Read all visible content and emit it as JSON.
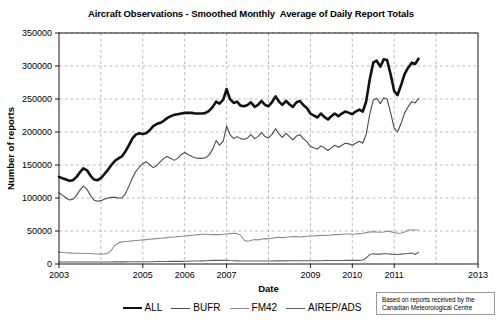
{
  "chart_data": {
    "type": "line",
    "title": "Aircraft Observations - Smoothed Monthly  Average of Daily Report Totals",
    "xlabel": "Date",
    "ylabel": "Number of reports",
    "xlim": [
      2003,
      2013
    ],
    "ylim": [
      0,
      350000
    ],
    "grid": true,
    "grid_style": "dashed",
    "legend_position": "bottom-center",
    "ytick_labels": [
      "0",
      "50000",
      "100000",
      "150000",
      "200000",
      "250000",
      "300000",
      "350000"
    ],
    "ytick_values": [
      0,
      50000,
      100000,
      150000,
      200000,
      250000,
      300000,
      350000
    ],
    "xtick_labels": [
      "2003",
      "2005",
      "2006",
      "2007",
      "2009",
      "2010",
      "2011",
      "2013"
    ],
    "xtick_values": [
      2003,
      2005,
      2006,
      2007,
      2009,
      2010,
      2011,
      2013
    ],
    "xgrid_values": [
      2004,
      2005,
      2006,
      2007,
      2008,
      2009,
      2010,
      2011,
      2012
    ],
    "annotation": {
      "line1": "Based on reports received by the",
      "line2": "Canadian Meteorological Centre"
    },
    "series": [
      {
        "name": "ALL",
        "color": "#111111",
        "width": 2.6,
        "x": [
          2003.0,
          2003.08,
          2003.17,
          2003.25,
          2003.33,
          2003.42,
          2003.5,
          2003.58,
          2003.67,
          2003.75,
          2003.83,
          2003.92,
          2004.0,
          2004.08,
          2004.17,
          2004.25,
          2004.33,
          2004.42,
          2004.5,
          2004.58,
          2004.67,
          2004.75,
          2004.83,
          2004.92,
          2005.0,
          2005.08,
          2005.17,
          2005.25,
          2005.33,
          2005.42,
          2005.5,
          2005.58,
          2005.67,
          2005.75,
          2005.83,
          2005.92,
          2006.0,
          2006.08,
          2006.17,
          2006.25,
          2006.33,
          2006.42,
          2006.5,
          2006.58,
          2006.67,
          2006.75,
          2006.83,
          2006.92,
          2007.0,
          2007.08,
          2007.17,
          2007.25,
          2007.33,
          2007.42,
          2007.5,
          2007.58,
          2007.67,
          2007.75,
          2007.83,
          2007.92,
          2008.0,
          2008.08,
          2008.17,
          2008.25,
          2008.33,
          2008.42,
          2008.5,
          2008.58,
          2008.67,
          2008.75,
          2008.83,
          2008.92,
          2009.0,
          2009.08,
          2009.17,
          2009.25,
          2009.33,
          2009.42,
          2009.5,
          2009.58,
          2009.67,
          2009.75,
          2009.83,
          2009.92,
          2010.0,
          2010.08,
          2010.17,
          2010.25,
          2010.33,
          2010.42,
          2010.5,
          2010.58,
          2010.67,
          2010.75,
          2010.83,
          2010.92,
          2011.0,
          2011.08,
          2011.17,
          2011.25,
          2011.33,
          2011.42,
          2011.5,
          2011.58
        ],
        "y": [
          132000,
          130000,
          128000,
          126000,
          127000,
          132000,
          139000,
          145000,
          142000,
          134000,
          128000,
          127000,
          130000,
          136000,
          143000,
          150000,
          156000,
          160000,
          163000,
          170000,
          180000,
          190000,
          196000,
          198000,
          197000,
          198000,
          203000,
          209000,
          212000,
          214000,
          217000,
          221000,
          224000,
          226000,
          227000,
          228000,
          229000,
          229000,
          229000,
          228000,
          228000,
          228000,
          229000,
          232000,
          238000,
          246000,
          243000,
          249000,
          265000,
          250000,
          244000,
          246000,
          240000,
          239000,
          241000,
          245000,
          238000,
          241000,
          247000,
          241000,
          239000,
          245000,
          254000,
          246000,
          241000,
          247000,
          242000,
          238000,
          245000,
          247000,
          241000,
          236000,
          228000,
          225000,
          222000,
          228000,
          223000,
          219000,
          224000,
          228000,
          224000,
          228000,
          231000,
          229000,
          227000,
          231000,
          234000,
          231000,
          246000,
          281000,
          305000,
          308000,
          299000,
          310000,
          309000,
          286000,
          262000,
          256000,
          272000,
          288000,
          297000,
          305000,
          303000,
          311000
        ]
      },
      {
        "name": "BUFR",
        "color": "#4a4a4a",
        "width": 1.1,
        "x": [
          2003.0,
          2003.08,
          2003.17,
          2003.25,
          2003.33,
          2003.42,
          2003.5,
          2003.58,
          2003.67,
          2003.75,
          2003.83,
          2003.92,
          2004.0,
          2004.08,
          2004.17,
          2004.25,
          2004.33,
          2004.42,
          2004.5,
          2004.58,
          2004.67,
          2004.75,
          2004.83,
          2004.92,
          2005.0,
          2005.08,
          2005.17,
          2005.25,
          2005.33,
          2005.42,
          2005.5,
          2005.58,
          2005.67,
          2005.75,
          2005.83,
          2005.92,
          2006.0,
          2006.08,
          2006.17,
          2006.25,
          2006.33,
          2006.42,
          2006.5,
          2006.58,
          2006.67,
          2006.75,
          2006.83,
          2006.92,
          2007.0,
          2007.08,
          2007.17,
          2007.25,
          2007.33,
          2007.42,
          2007.5,
          2007.58,
          2007.67,
          2007.75,
          2007.83,
          2007.92,
          2008.0,
          2008.08,
          2008.17,
          2008.25,
          2008.33,
          2008.42,
          2008.5,
          2008.58,
          2008.67,
          2008.75,
          2008.83,
          2008.92,
          2009.0,
          2009.08,
          2009.17,
          2009.25,
          2009.33,
          2009.42,
          2009.5,
          2009.58,
          2009.67,
          2009.75,
          2009.83,
          2009.92,
          2010.0,
          2010.08,
          2010.17,
          2010.25,
          2010.33,
          2010.42,
          2010.5,
          2010.58,
          2010.67,
          2010.75,
          2010.83,
          2010.92,
          2011.0,
          2011.08,
          2011.17,
          2011.25,
          2011.33,
          2011.42,
          2011.5,
          2011.58
        ],
        "y": [
          108000,
          104000,
          100000,
          97000,
          98000,
          104000,
          112000,
          118000,
          113000,
          104000,
          97000,
          95000,
          96000,
          98000,
          100000,
          101000,
          101000,
          100000,
          100000,
          106000,
          118000,
          130000,
          140000,
          147000,
          152000,
          155000,
          150000,
          146000,
          149000,
          155000,
          160000,
          163000,
          160000,
          157000,
          160000,
          166000,
          169000,
          166000,
          163000,
          161000,
          160000,
          160000,
          161000,
          165000,
          174000,
          187000,
          180000,
          186000,
          209000,
          196000,
          190000,
          193000,
          190000,
          189000,
          191000,
          196000,
          190000,
          193000,
          199000,
          193000,
          191000,
          196000,
          205000,
          197000,
          192000,
          198000,
          193000,
          188000,
          194000,
          196000,
          190000,
          185000,
          178000,
          176000,
          174000,
          179000,
          176000,
          172000,
          176000,
          180000,
          177000,
          180000,
          183000,
          182000,
          180000,
          183000,
          186000,
          183000,
          196000,
          228000,
          248000,
          251000,
          243000,
          252000,
          250000,
          228000,
          206000,
          200000,
          214000,
          229000,
          238000,
          246000,
          244000,
          251000
        ]
      },
      {
        "name": "FM42",
        "color": "#8d8d8d",
        "width": 1.1,
        "x": [
          2003.0,
          2003.08,
          2003.17,
          2003.25,
          2003.33,
          2003.42,
          2003.5,
          2003.58,
          2003.67,
          2003.75,
          2003.83,
          2003.92,
          2004.0,
          2004.08,
          2004.17,
          2004.25,
          2004.33,
          2004.42,
          2004.5,
          2004.58,
          2004.67,
          2004.75,
          2004.83,
          2004.92,
          2005.0,
          2005.08,
          2005.17,
          2005.25,
          2005.33,
          2005.42,
          2005.5,
          2005.58,
          2005.67,
          2005.75,
          2005.83,
          2005.92,
          2006.0,
          2006.08,
          2006.17,
          2006.25,
          2006.33,
          2006.42,
          2006.5,
          2006.58,
          2006.67,
          2006.75,
          2006.83,
          2006.92,
          2007.0,
          2007.08,
          2007.17,
          2007.25,
          2007.33,
          2007.42,
          2007.5,
          2007.58,
          2007.67,
          2007.75,
          2007.83,
          2007.92,
          2008.0,
          2008.08,
          2008.17,
          2008.25,
          2008.33,
          2008.42,
          2008.5,
          2008.58,
          2008.67,
          2008.75,
          2008.83,
          2008.92,
          2009.0,
          2009.08,
          2009.17,
          2009.25,
          2009.33,
          2009.42,
          2009.5,
          2009.58,
          2009.67,
          2009.75,
          2009.83,
          2009.92,
          2010.0,
          2010.08,
          2010.17,
          2010.25,
          2010.33,
          2010.42,
          2010.5,
          2010.58,
          2010.67,
          2010.75,
          2010.83,
          2010.92,
          2011.0,
          2011.08,
          2011.17,
          2011.25,
          2011.33,
          2011.42,
          2011.5,
          2011.58
        ],
        "y": [
          18000,
          17500,
          17000,
          16800,
          16500,
          16300,
          16200,
          16000,
          16000,
          15800,
          15500,
          15200,
          15000,
          15200,
          16500,
          21000,
          28000,
          32000,
          33500,
          34000,
          34500,
          35000,
          35500,
          36000,
          36500,
          37000,
          37500,
          38000,
          38500,
          39000,
          39500,
          40000,
          40500,
          41000,
          41500,
          42000,
          42500,
          43000,
          43500,
          44000,
          44500,
          45000,
          45000,
          44800,
          44500,
          44500,
          44500,
          45000,
          45500,
          46000,
          46500,
          46000,
          44000,
          36000,
          34500,
          35500,
          37000,
          36500,
          37500,
          38500,
          38000,
          39000,
          40000,
          40500,
          40000,
          40500,
          41000,
          41500,
          41500,
          41000,
          41500,
          42000,
          42500,
          42500,
          43000,
          43500,
          43000,
          43500,
          44000,
          44500,
          44500,
          45000,
          45500,
          45500,
          45000,
          45500,
          46000,
          46500,
          47500,
          48500,
          49000,
          48500,
          48000,
          48500,
          49500,
          49000,
          47500,
          46500,
          47000,
          48500,
          51000,
          52000,
          51500,
          51500
        ]
      },
      {
        "name": "AIREP/ADS",
        "color": "#5e5e5e",
        "width": 1.1,
        "x": [
          2003.0,
          2003.08,
          2003.17,
          2003.25,
          2003.33,
          2003.42,
          2003.5,
          2003.58,
          2003.67,
          2003.75,
          2003.83,
          2003.92,
          2004.0,
          2004.08,
          2004.17,
          2004.25,
          2004.33,
          2004.42,
          2004.5,
          2004.58,
          2004.67,
          2004.75,
          2004.83,
          2004.92,
          2005.0,
          2005.08,
          2005.17,
          2005.25,
          2005.33,
          2005.42,
          2005.5,
          2005.58,
          2005.67,
          2005.75,
          2005.83,
          2005.92,
          2006.0,
          2006.08,
          2006.17,
          2006.25,
          2006.33,
          2006.42,
          2006.5,
          2006.58,
          2006.67,
          2006.75,
          2006.83,
          2006.92,
          2007.0,
          2007.08,
          2007.17,
          2007.25,
          2007.33,
          2007.42,
          2007.5,
          2007.58,
          2007.67,
          2007.75,
          2007.83,
          2007.92,
          2008.0,
          2008.08,
          2008.17,
          2008.25,
          2008.33,
          2008.42,
          2008.5,
          2008.58,
          2008.67,
          2008.75,
          2008.83,
          2008.92,
          2009.0,
          2009.08,
          2009.17,
          2009.25,
          2009.33,
          2009.42,
          2009.5,
          2009.58,
          2009.67,
          2009.75,
          2009.83,
          2009.92,
          2010.0,
          2010.08,
          2010.17,
          2010.25,
          2010.33,
          2010.42,
          2010.5,
          2010.58,
          2010.67,
          2010.75,
          2010.83,
          2010.92,
          2011.0,
          2011.08,
          2011.17,
          2011.25,
          2011.33,
          2011.42,
          2011.5,
          2011.58
        ],
        "y": [
          3000,
          3000,
          3000,
          3000,
          3000,
          3000,
          3000,
          3000,
          3000,
          3000,
          3000,
          3000,
          3000,
          3000,
          3000,
          3000,
          3200,
          3200,
          3200,
          3200,
          3500,
          3500,
          3500,
          3500,
          3500,
          3500,
          3500,
          3500,
          3800,
          3800,
          3800,
          3800,
          4000,
          4000,
          4000,
          4000,
          4200,
          4200,
          4500,
          4500,
          4500,
          4800,
          5000,
          5200,
          5500,
          5500,
          5500,
          5500,
          5500,
          5200,
          5000,
          4800,
          4500,
          4500,
          4500,
          4500,
          4500,
          4500,
          4500,
          4500,
          4500,
          4500,
          4800,
          4800,
          4800,
          4800,
          5000,
          5000,
          5000,
          5000,
          5000,
          5000,
          5000,
          5000,
          5000,
          5000,
          5200,
          5200,
          5200,
          5200,
          5200,
          5200,
          5500,
          5500,
          5500,
          5500,
          5500,
          6000,
          9000,
          14500,
          15500,
          15000,
          15000,
          15500,
          15500,
          15000,
          14500,
          14500,
          15000,
          15500,
          16000,
          16500,
          14500,
          17500
        ]
      }
    ]
  }
}
